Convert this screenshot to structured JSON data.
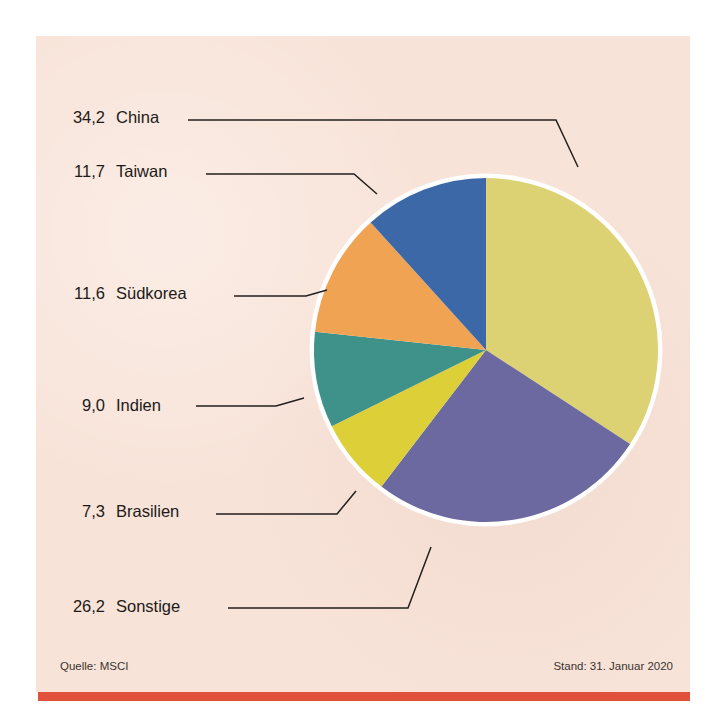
{
  "chart_data": {
    "type": "pie",
    "title": "",
    "subtitle": "",
    "xlabel": "",
    "ylabel": "",
    "unit": "%",
    "legend_position": "left-callouts",
    "grid": false,
    "start_angle_deg": 0,
    "direction": "clockwise",
    "categories": [
      "China",
      "Taiwan",
      "Südkorea",
      "Indien",
      "Brasilien",
      "Sonstige"
    ],
    "values": [
      34.2,
      11.7,
      11.6,
      9.0,
      7.3,
      26.2
    ],
    "value_labels": [
      "34,2",
      "11,7",
      "11,6",
      "9,0",
      "7,3",
      "26,2"
    ],
    "colors": [
      "#dcd173",
      "#3d68a8",
      "#f0a353",
      "#3f9289",
      "#dccf38",
      "#6c68a0"
    ],
    "slice_order_clockwise": [
      "China",
      "Sonstige",
      "Brasilien",
      "Indien",
      "Südkorea",
      "Taiwan"
    ],
    "slices": [
      {
        "name": "China",
        "value": 34.2,
        "value_label": "34,2",
        "color": "#dcd173",
        "label_y": 123
      },
      {
        "name": "Taiwan",
        "value": 11.7,
        "value_label": "11,7",
        "color": "#3d68a8",
        "label_y": 177
      },
      {
        "name": "Südkorea",
        "value": 11.6,
        "value_label": "11,6",
        "color": "#f0a353",
        "label_y": 299
      },
      {
        "name": "Indien",
        "value": 9.0,
        "value_label": "9,0",
        "color": "#3f9289",
        "label_y": 411
      },
      {
        "name": "Brasilien",
        "value": 7.3,
        "value_label": "7,3",
        "color": "#dccf38",
        "label_y": 517
      },
      {
        "name": "Sonstige",
        "value": 26.2,
        "value_label": "26,2",
        "color": "#6c68a0",
        "label_y": 612
      }
    ]
  },
  "geometry": {
    "center_x": 486,
    "center_y": 350,
    "radius": 172,
    "ring_width": 9,
    "value_label_x": 105,
    "name_label_x": 116
  },
  "footer": {
    "source": "Quelle: MSCI",
    "as_of": "Stand: 31. Januar 2020"
  },
  "style": {
    "panel_bg": "#f8e3d8",
    "rule_color": "#e0503a",
    "text_color": "#1d1a18",
    "ring_color": "#ffffff"
  },
  "leaders": [
    {
      "name": "China",
      "d": "M 188 120 L 556 120 L 578 167"
    },
    {
      "name": "Taiwan",
      "d": "M 206 174 L 354 174 L 377 194"
    },
    {
      "name": "Südkorea",
      "d": "M 234 296 L 306 296 L 327 290"
    },
    {
      "name": "Indien",
      "d": "M 196 406 L 276 406 L 304 398"
    },
    {
      "name": "Brasilien",
      "d": "M 216 514 L 337 514 L 356 491"
    },
    {
      "name": "Sonstige",
      "d": "M 228 608 L 408 608 L 431 547"
    }
  ]
}
